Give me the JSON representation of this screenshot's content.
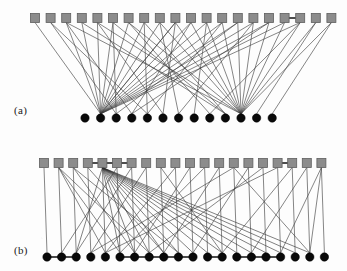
{
  "figure": {
    "background_color": "#fdfdfd",
    "panels": [
      {
        "id": "a",
        "label": "(a)",
        "top_node_shape": "square",
        "bottom_node_shape": "circle",
        "top_node_color": "#8c8c8c",
        "bottom_node_color": "#090909",
        "edge_color": "#3a3a3a",
        "top_node_count": 20,
        "bottom_node_count": 13,
        "bottom_rail": false,
        "edge_count": 54
      },
      {
        "id": "b",
        "label": "(b)",
        "top_node_shape": "square",
        "bottom_node_shape": "circle",
        "top_node_color": "#8c8c8c",
        "bottom_node_color": "#090909",
        "edge_color": "#3a3a3a",
        "top_node_count": 20,
        "bottom_node_count": 20,
        "bottom_rail": true,
        "edge_count": 58
      }
    ]
  },
  "chart_data": {
    "type": "diagram",
    "panels": [
      {
        "name": "(a)",
        "top_row": {
          "shape": "square",
          "count": 20,
          "y": 18,
          "x_start": 35,
          "x_step": 15.6,
          "size": 9,
          "fill": "#8c8c8c",
          "stroke": "#5e5e5e"
        },
        "bottom_row": {
          "shape": "circle",
          "count": 13,
          "y": 118,
          "x_start": 85,
          "x_step": 15.6,
          "radius": 4.2,
          "fill": "#090909",
          "rail": false
        },
        "top_rail_segments": [
          [
            16,
            17
          ]
        ],
        "edges": [
          [
            0,
            1
          ],
          [
            1,
            2
          ],
          [
            1,
            4
          ],
          [
            2,
            1
          ],
          [
            2,
            3
          ],
          [
            3,
            1
          ],
          [
            4,
            1
          ],
          [
            4,
            5
          ],
          [
            5,
            2
          ],
          [
            5,
            1
          ],
          [
            6,
            1
          ],
          [
            6,
            8
          ],
          [
            7,
            4
          ],
          [
            7,
            1
          ],
          [
            8,
            1
          ],
          [
            8,
            6
          ],
          [
            8,
            10
          ],
          [
            9,
            1
          ],
          [
            9,
            5
          ],
          [
            9,
            10
          ],
          [
            10,
            3
          ],
          [
            10,
            10
          ],
          [
            11,
            1
          ],
          [
            11,
            7
          ],
          [
            11,
            10
          ],
          [
            12,
            4
          ],
          [
            12,
            10
          ],
          [
            13,
            1
          ],
          [
            13,
            10
          ],
          [
            13,
            2
          ],
          [
            14,
            10
          ],
          [
            14,
            6
          ],
          [
            15,
            10
          ],
          [
            15,
            3
          ],
          [
            16,
            10
          ],
          [
            16,
            1
          ],
          [
            17,
            10
          ],
          [
            17,
            8
          ],
          [
            18,
            10
          ],
          [
            18,
            11
          ],
          [
            19,
            12
          ],
          [
            19,
            10
          ],
          [
            3,
            9
          ],
          [
            5,
            9
          ],
          [
            7,
            9
          ],
          [
            12,
            1
          ],
          [
            10,
            1
          ],
          [
            14,
            1
          ],
          [
            6,
            10
          ],
          [
            2,
            10
          ],
          [
            4,
            10
          ],
          [
            9,
            1
          ],
          [
            17,
            1
          ],
          [
            15,
            1
          ]
        ]
      },
      {
        "name": "(b)",
        "top_row": {
          "shape": "square",
          "count": 20,
          "y": 23,
          "x_start": 44,
          "x_step": 14.6,
          "size": 9,
          "fill": "#8c8c8c",
          "stroke": "#5e5e5e"
        },
        "bottom_row": {
          "shape": "circle",
          "count": 20,
          "y": 117,
          "x_start": 47,
          "x_step": 14.6,
          "radius": 4.2,
          "fill": "#090909",
          "rail": true
        },
        "top_rail_segments": [
          [
            3,
            4
          ],
          [
            4,
            5
          ],
          [
            5,
            6
          ],
          [
            16,
            17
          ]
        ],
        "bottom_rail_segments": [
          [
            0,
            1
          ],
          [
            1,
            2
          ],
          [
            5,
            6
          ],
          [
            6,
            7
          ],
          [
            7,
            8
          ],
          [
            8,
            9
          ],
          [
            9,
            10
          ],
          [
            11,
            12
          ],
          [
            13,
            14
          ],
          [
            14,
            15
          ],
          [
            15,
            16
          ]
        ],
        "dense_hub_top_index": 4,
        "edges": [
          [
            0,
            0
          ],
          [
            1,
            1
          ],
          [
            1,
            4
          ],
          [
            1,
            5
          ],
          [
            1,
            7
          ],
          [
            2,
            2
          ],
          [
            2,
            6
          ],
          [
            2,
            9
          ],
          [
            3,
            3
          ],
          [
            3,
            8
          ],
          [
            4,
            2
          ],
          [
            4,
            4
          ],
          [
            4,
            5
          ],
          [
            4,
            6
          ],
          [
            4,
            7
          ],
          [
            4,
            8
          ],
          [
            4,
            9
          ],
          [
            4,
            10
          ],
          [
            4,
            11
          ],
          [
            4,
            12
          ],
          [
            4,
            13
          ],
          [
            4,
            14
          ],
          [
            4,
            15
          ],
          [
            4,
            16
          ],
          [
            4,
            17
          ],
          [
            4,
            18
          ],
          [
            5,
            5
          ],
          [
            5,
            1
          ],
          [
            6,
            6
          ],
          [
            6,
            2
          ],
          [
            7,
            7
          ],
          [
            7,
            3
          ],
          [
            8,
            8
          ],
          [
            8,
            12
          ],
          [
            9,
            9
          ],
          [
            9,
            4
          ],
          [
            10,
            10
          ],
          [
            10,
            6
          ],
          [
            11,
            11
          ],
          [
            11,
            5
          ],
          [
            12,
            12
          ],
          [
            12,
            8
          ],
          [
            13,
            13
          ],
          [
            13,
            3
          ],
          [
            14,
            14
          ],
          [
            14,
            10
          ],
          [
            15,
            15
          ],
          [
            15,
            7
          ],
          [
            16,
            16
          ],
          [
            16,
            4
          ],
          [
            17,
            17
          ],
          [
            17,
            12
          ],
          [
            18,
            18
          ],
          [
            18,
            14
          ],
          [
            19,
            19
          ],
          [
            19,
            16
          ],
          [
            19,
            18
          ],
          [
            13,
            18
          ]
        ]
      }
    ]
  }
}
